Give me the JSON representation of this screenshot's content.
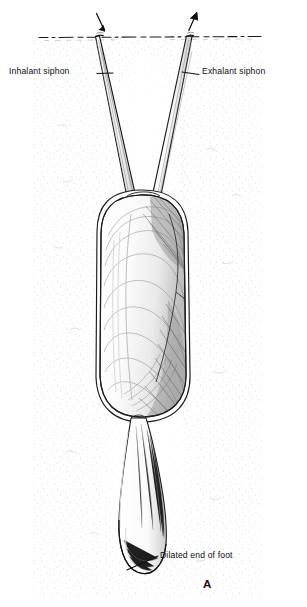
{
  "figure": {
    "panel_letter": "A",
    "colors": {
      "ink": "#111111",
      "background": "#ffffff",
      "sediment_stipple": "#8d8d8d",
      "shell_shading": "#6b6b6b"
    }
  },
  "labels": {
    "inhalant_siphon": "Inhalant siphon",
    "exhalant_siphon": "Exhalant siphon",
    "dilated_end_of_foot": "Dilated end of foot"
  },
  "icons": {
    "inflow_arrow": "arrow-down-inflow-icon",
    "outflow_arrow": "arrow-up-outflow-icon",
    "sediment_surface": "dashed-sediment-surface-line"
  },
  "structures": {
    "sediment_surface_line": "sediment surface",
    "inhalant_siphon_tube": "inhalant siphon",
    "exhalant_siphon_tube": "exhalant siphon",
    "shell_valve": "shell valve with growth lines",
    "foot": "foot",
    "dilated_foot_tip": "dilated end of foot"
  }
}
